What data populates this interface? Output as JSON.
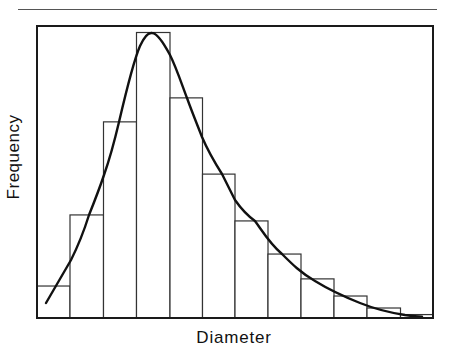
{
  "chart_data": {
    "type": "bar",
    "subtype": "histogram-with-fitted-curve",
    "title": "",
    "xlabel": "Diameter",
    "ylabel": "Frequency",
    "x_ticks": [],
    "y_ticks": [],
    "grid": false,
    "legend": null,
    "categories": [
      "bin1",
      "bin2",
      "bin3",
      "bin4",
      "bin5",
      "bin6",
      "bin7",
      "bin8",
      "bin9",
      "bin10",
      "bin11",
      "bin12"
    ],
    "values": [
      11.2,
      36.1,
      68.7,
      100,
      77.1,
      50.4,
      34.0,
      22.4,
      13.7,
      7.7,
      3.5,
      1.2
    ],
    "value_units": "relative frequency (peak bin = 100; axis unlabeled)",
    "ylim": [
      0,
      100
    ],
    "series": [
      {
        "name": "histogram",
        "kind": "bar",
        "values": [
          11.2,
          36.1,
          68.7,
          100,
          77.1,
          50.4,
          34.0,
          22.4,
          13.7,
          7.7,
          3.5,
          1.2
        ]
      },
      {
        "name": "fitted distribution",
        "kind": "line",
        "shape": "right-skewed (log-normal-like)",
        "peak_bin": 4,
        "points": [
          [
            0.28,
            5.3
          ],
          [
            1.0,
            20.3
          ],
          [
            1.58,
            36.1
          ],
          [
            2.0,
            50.2
          ],
          [
            2.5,
            68.7
          ],
          [
            3.0,
            94.0
          ],
          [
            3.45,
            100
          ],
          [
            4.0,
            91.9
          ],
          [
            4.5,
            77.1
          ],
          [
            5.0,
            63.3
          ],
          [
            5.55,
            50.4
          ],
          [
            6.0,
            41.0
          ],
          [
            6.6,
            34.0
          ],
          [
            7.5,
            22.4
          ],
          [
            8.5,
            13.7
          ],
          [
            9.5,
            7.7
          ],
          [
            10.5,
            3.5
          ],
          [
            11.6,
            0.4
          ]
        ]
      }
    ]
  },
  "render": {
    "baseline_y": 318,
    "frame": {
      "x": 37,
      "y": 26,
      "w": 396,
      "h": 292
    },
    "bar_edges": [
      37,
      70,
      103.5,
      136.5,
      170,
      202.5,
      235,
      268,
      301,
      334,
      367,
      400.5,
      433
    ],
    "plot_height_px": 285.5,
    "curve_path": "M46,303 C56,286 64,272 71,260 C78,246 84,231 89,215 C95,200 100,187 104,175 C110,158 115,139 119,122 C126,92 133,62 140,46 C145,35 149,32.5 152,33 C156,33 162,40 170,55 C176,67 181,82 187,98 C192,112 197,124 202,137 C208,151 215,163 222,174 C227,184 231,192 235,200 C242,210 248,216 255,221 C263,232 270,244 282,254 C292,264 301,273 315,281 C328,289 345,297 360,303 C375,309 392,313 405,315 C413,316 418,316.5 422,316.7",
    "colors": {
      "line": "#111111",
      "bar_stroke": "#333333",
      "bar_fill": "#ffffff",
      "frame": "#1a1a1a",
      "rule": "#555555"
    }
  }
}
